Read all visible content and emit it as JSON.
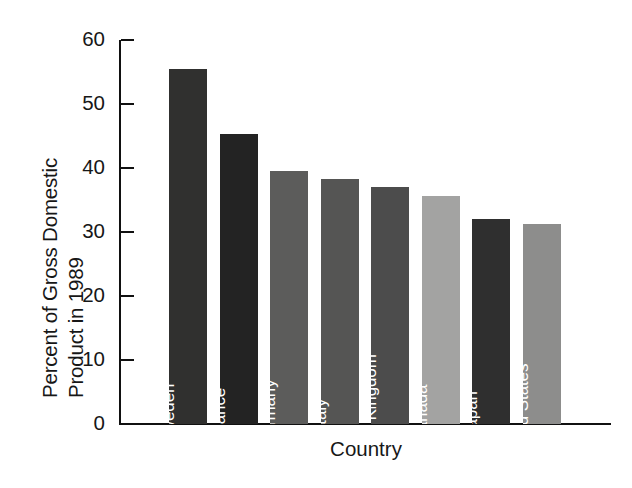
{
  "chart_data": {
    "type": "bar",
    "title": "",
    "xlabel": "Country",
    "ylabel": "Percent of Gross Domestic Product in 1989",
    "ylabel_lines": [
      "Percent of Gross Domestic",
      "Product in 1989"
    ],
    "categories": [
      "Sweden",
      "France",
      "Germany",
      "Italy",
      "United Kingdom",
      "Canada",
      "Japan",
      "United States"
    ],
    "values": [
      55.5,
      45.3,
      39.5,
      38.3,
      37.0,
      35.7,
      32.0,
      31.2
    ],
    "ylim": [
      0,
      60
    ],
    "yticks": [
      0,
      10,
      20,
      30,
      40,
      50,
      60
    ],
    "ytick_labels": [
      "0",
      "10",
      "20",
      "30",
      "40",
      "50",
      "60"
    ],
    "grid": false,
    "legend": "none",
    "bar_colors": [
      "#30302f",
      "#232323",
      "#5c5c5b",
      "#555554",
      "#4c4c4c",
      "#a3a3a2",
      "#2f2f2f",
      "#8d8d8c"
    ],
    "bar_label_color": "#ffffff",
    "axis_color": "#111111",
    "background": "#ffffff"
  }
}
